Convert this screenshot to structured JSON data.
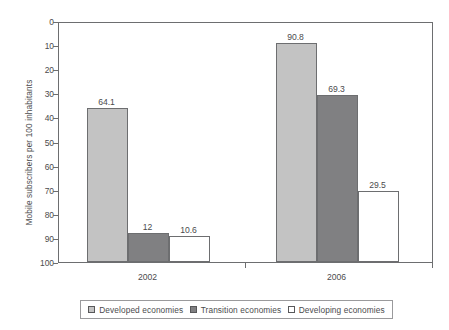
{
  "chart_data": {
    "type": "bar",
    "title": "",
    "subtitle": "",
    "xlabel": "",
    "ylabel": "Mobile subscribers per 100 inhabitants",
    "categories": [
      "2002",
      "2006"
    ],
    "series": [
      {
        "name": "Developed economies",
        "values": [
          64.1,
          90.8
        ],
        "labels": [
          "64.1",
          "90.8"
        ],
        "color": "#c3c3c3"
      },
      {
        "name": "Transition economies",
        "values": [
          12,
          69.3
        ],
        "labels": [
          "12",
          "69.3"
        ],
        "color": "#808082"
      },
      {
        "name": "Developing economies",
        "values": [
          10.6,
          29.5
        ],
        "labels": [
          "10.6",
          "29.5"
        ],
        "color": "#ffffff"
      }
    ],
    "ylim": [
      0,
      100
    ],
    "ytick_values": [
      0,
      10,
      20,
      30,
      40,
      50,
      60,
      70,
      80,
      90,
      100
    ],
    "ytick_labels": [
      "0",
      "10",
      "20",
      "30",
      "40",
      "50",
      "60",
      "70",
      "80",
      "90",
      "100"
    ],
    "grid": false,
    "legend_position": "bottom"
  },
  "axis": {
    "y_title": "Mobile subscribers per 100 inhabitants",
    "ticks": [
      {
        "label": "100"
      },
      {
        "label": "90"
      },
      {
        "label": "80"
      },
      {
        "label": "70"
      },
      {
        "label": "60"
      },
      {
        "label": "50"
      },
      {
        "label": "40"
      },
      {
        "label": "30"
      },
      {
        "label": "20"
      },
      {
        "label": "10"
      },
      {
        "label": "0"
      }
    ],
    "x_labels": [
      {
        "label": "2002"
      },
      {
        "label": "2006"
      }
    ]
  },
  "bars": [
    {
      "value_label": "64.1"
    },
    {
      "value_label": "12"
    },
    {
      "value_label": "10.6"
    },
    {
      "value_label": "90.8"
    },
    {
      "value_label": "69.3"
    },
    {
      "value_label": "29.5"
    }
  ],
  "legend": {
    "items": [
      {
        "label": "Developed economies"
      },
      {
        "label": "Transition economies"
      },
      {
        "label": "Developing economies"
      }
    ]
  }
}
